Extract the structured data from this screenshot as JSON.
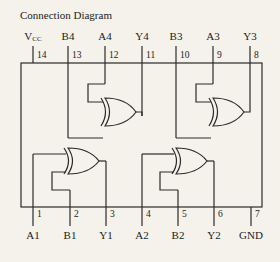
{
  "title": "Connection Diagram",
  "chip": {
    "top_pins": [
      {
        "number": "14",
        "label": "V",
        "sub": "CC",
        "x": 33
      },
      {
        "number": "13",
        "label": "B4",
        "x": 68
      },
      {
        "number": "12",
        "label": "A4",
        "x": 105
      },
      {
        "number": "11",
        "label": "Y4",
        "x": 142
      },
      {
        "number": "10",
        "label": "B3",
        "x": 176
      },
      {
        "number": "9",
        "label": "A3",
        "x": 213
      },
      {
        "number": "8",
        "label": "Y3",
        "x": 250
      }
    ],
    "bottom_pins": [
      {
        "number": "1",
        "label": "A1",
        "x": 33
      },
      {
        "number": "2",
        "label": "B1",
        "x": 70
      },
      {
        "number": "3",
        "label": "Y1",
        "x": 106
      },
      {
        "number": "4",
        "label": "A2",
        "x": 142
      },
      {
        "number": "5",
        "label": "B2",
        "x": 178
      },
      {
        "number": "6",
        "label": "Y2",
        "x": 214
      },
      {
        "number": "7",
        "label": "GND",
        "x": 251
      }
    ],
    "gates": [
      {
        "type": "XOR",
        "inputs": [
          "A4",
          "B4"
        ],
        "output": "Y4"
      },
      {
        "type": "XOR",
        "inputs": [
          "A3",
          "B3"
        ],
        "output": "Y3"
      },
      {
        "type": "XOR",
        "inputs": [
          "A1",
          "B1"
        ],
        "output": "Y1"
      },
      {
        "type": "XOR",
        "inputs": [
          "A2",
          "B2"
        ],
        "output": "Y2"
      }
    ]
  },
  "colors": {
    "line": "#2a2a2a",
    "background": "#f4f2ea"
  }
}
